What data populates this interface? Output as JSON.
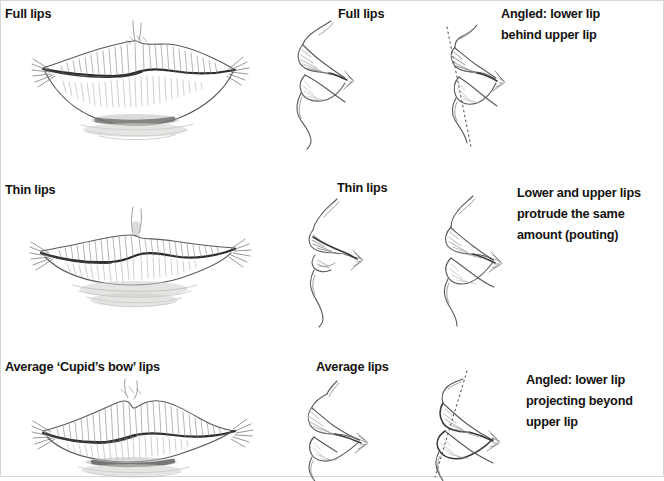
{
  "page": {
    "background_color": "#ffffff",
    "ink_color": "#5c5a58",
    "text_color": "#14120f"
  },
  "rows": [
    {
      "id": "full",
      "front_label": "Full lips",
      "profile_label": "Full lips",
      "angled_label": "Angled: lower lip\nbehind upper lip"
    },
    {
      "id": "thin",
      "front_label": "Thin lips",
      "profile_label": "Thin lips",
      "angled_label": "Lower and upper lips\nprotrude the same\namount (pouting)"
    },
    {
      "id": "average",
      "front_label": "Average ‘Cupid’s bow’ lips",
      "profile_label": "Average lips",
      "angled_label": "Angled: lower lip\nprojecting beyond\nupper lip"
    }
  ],
  "figures": {
    "full_front": "pencil-sketch-full-lips-front-view",
    "full_profile": "pencil-sketch-full-lips-profile-view",
    "full_angled": "pencil-sketch-full-lips-angled-profile-view",
    "thin_front": "pencil-sketch-thin-lips-front-view",
    "thin_profile": "pencil-sketch-thin-lips-profile-view",
    "thin_angled": "pencil-sketch-thin-lips-angled-profile-view",
    "average_front": "pencil-sketch-average-cupids-bow-lips-front-view",
    "average_profile": "pencil-sketch-average-lips-profile-view",
    "average_angled": "pencil-sketch-average-lips-angled-profile-view"
  }
}
